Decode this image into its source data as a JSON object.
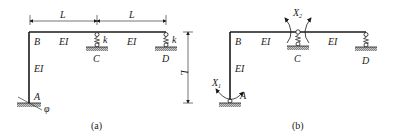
{
  "figure_a": {
    "caption": "(a)",
    "dim_span_left": "L",
    "dim_span_right": "L",
    "dim_height": "L",
    "node_A": "A",
    "node_B": "B",
    "node_C": "C",
    "node_D": "D",
    "beam_BC_label": "EI",
    "beam_CD_label": "EI",
    "column_AB_label": "EI",
    "spring_C_label": "k",
    "spring_D_label": "k",
    "rotation_A_label": "φ"
  },
  "figure_b": {
    "caption": "(b)",
    "node_A": "A",
    "node_B": "B",
    "node_C": "C",
    "node_D": "D",
    "beam_BC_label": "EI",
    "beam_CD_label": "EI",
    "column_AB_label": "EI",
    "unknown_1": "X",
    "unknown_1_sub": "1",
    "unknown_2": "X",
    "unknown_2_sub": "2"
  },
  "colors": {
    "stroke": "#1a1a1a",
    "ground_hatch": "#8a8a8a"
  }
}
